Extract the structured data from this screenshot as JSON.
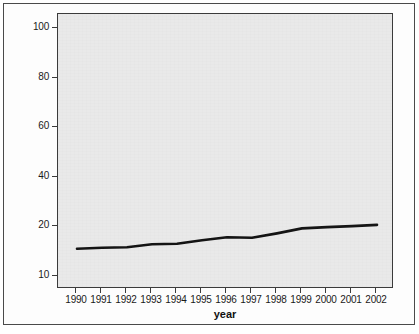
{
  "chart_data": {
    "type": "line",
    "title": "",
    "subtitle": "",
    "xlabel": "year",
    "ylabel": "",
    "grid": false,
    "legend": "none",
    "categories": [
      1990,
      1991,
      1992,
      1993,
      1994,
      1995,
      1996,
      1997,
      1998,
      1999,
      2000,
      2001,
      2002
    ],
    "x_tick_labels": [
      "1990",
      "1991",
      "1992",
      "1993",
      "1994",
      "1995",
      "1996",
      "1997",
      "1998",
      "1999",
      "2000",
      "2001",
      "2002"
    ],
    "y_tick_labels": [
      "100",
      "80",
      "60",
      "40",
      "20",
      "10"
    ],
    "y_tick_values": [
      100,
      80,
      60,
      40,
      20,
      10
    ],
    "xlim": [
      1990,
      2002
    ],
    "ylim": [
      10,
      100
    ],
    "series": [
      {
        "name": "",
        "color": "#141414",
        "values": [
          15.7,
          15.9,
          16.0,
          16.6,
          16.7,
          17.4,
          18.0,
          17.9,
          18.8,
          19.8,
          20.1,
          20.5,
          21.0
        ]
      }
    ]
  },
  "axes": {
    "x_title": "year"
  },
  "figure": {
    "panel_background": "#e9e9e9",
    "frame_color": "#3b3b3b",
    "line_color": "#141414"
  }
}
